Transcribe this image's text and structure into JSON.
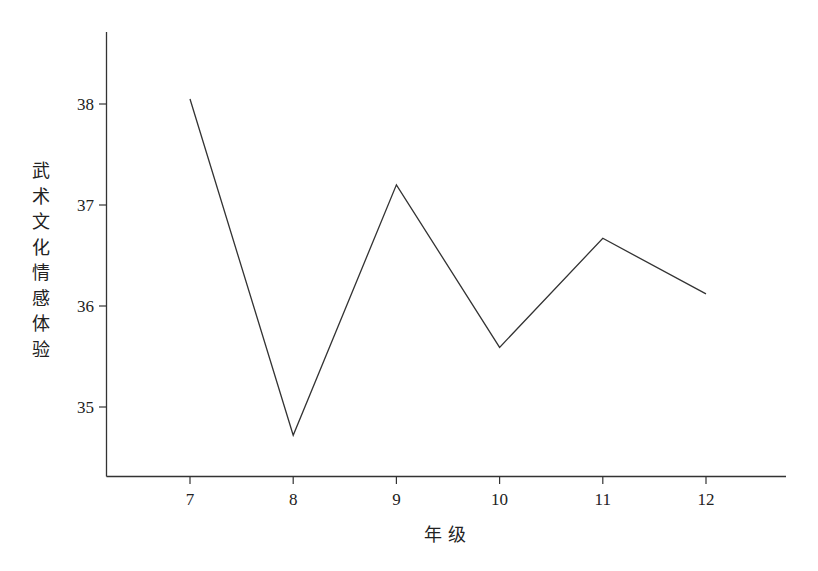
{
  "chart_data": {
    "type": "line",
    "title": "",
    "xlabel": "年 级",
    "ylabel": "武术文化情感体验",
    "categories": [
      "7",
      "8",
      "9",
      "10",
      "11",
      "12"
    ],
    "x": [
      7,
      8,
      9,
      10,
      11,
      12
    ],
    "values": [
      38.05,
      34.72,
      37.2,
      35.59,
      36.67,
      36.12
    ],
    "series": [
      {
        "name": "武术文化情感体验",
        "values": [
          38.05,
          34.72,
          37.2,
          35.59,
          36.67,
          36.12
        ]
      }
    ],
    "yticks": [
      35,
      36,
      37,
      38
    ],
    "xticks": [
      7,
      8,
      9,
      10,
      11,
      12
    ],
    "ylim": [
      34.3,
      38.7
    ],
    "xlim": [
      6.15,
      12.8
    ],
    "grid": false,
    "legend": "none",
    "line_color": "#333333"
  },
  "axes": {
    "x_title": "年 级",
    "y_title_chars": [
      "武",
      "术",
      "文",
      "化",
      "情",
      "感",
      "体",
      "验"
    ]
  }
}
